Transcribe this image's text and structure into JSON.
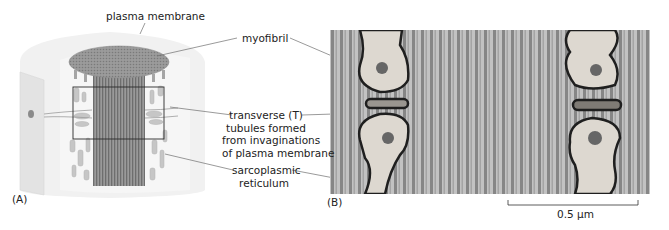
{
  "figure": {
    "panel_a": {
      "tag": "(A)",
      "labels": {
        "plasma_membrane": "plasma membrane",
        "myofibril": "myofibril",
        "t_tubules": [
          "transverse (T)",
          "tubules formed",
          "from invaginations",
          "of plasma membrane"
        ],
        "sarcoplasmic_reticulum": [
          "sarcoplasmic",
          "reticulum"
        ]
      }
    },
    "panel_b": {
      "tag": "(B)",
      "scale_bar": {
        "label": "0.5 µm"
      }
    },
    "colors": {
      "myofibril": "#8a8a8a",
      "cylinder": "#efefef",
      "reticulum": "#c8c8c8",
      "leader_line": "#6f6f6f",
      "micrograph_bg": "#b9b9b9"
    }
  }
}
